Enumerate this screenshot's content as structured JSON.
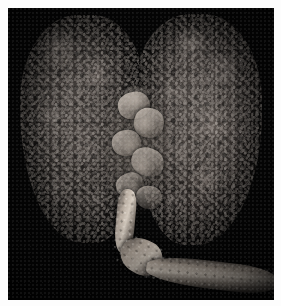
{
  "image": {
    "domain": "Natural-Image",
    "subject": "gross-pathology-lung-specimen",
    "alt_text": "Dark gross pathology photograph of a pair of lungs with nodular studded surfaces, central hilar structures, and a trachea/esophagus extending to the lower right",
    "background_color": "#050505",
    "frame_color": "#fdfdfd",
    "width": 281,
    "height": 306
  },
  "frame": {
    "border_top_px": 8,
    "border_left_px": 8,
    "border_right_px": 7,
    "border_bottom_px": 6
  },
  "specimen": {
    "parts": [
      {
        "id": "lung-left",
        "label": "left lung",
        "surface": "nodular",
        "tone": "#3a3532"
      },
      {
        "id": "lung-right",
        "label": "right lung",
        "surface": "nodular",
        "tone": "#413b37"
      },
      {
        "id": "hilum",
        "label": "hilar structures",
        "tone": "#cec4ba"
      },
      {
        "id": "tube",
        "label": "trachea and esophagus",
        "tone": "#d4c6ba"
      }
    ],
    "palette": {
      "background": "#050505",
      "tissue_dark": "#23201e",
      "tissue_mid": "#5a534e",
      "tissue_light": "#beb4aa",
      "tube_highlight": "#d6ccbe"
    }
  },
  "hilum_chunks": [
    {
      "left": "20%",
      "top": "6%",
      "width": "46%",
      "height": "20%",
      "rot": "-12deg"
    },
    {
      "left": "44%",
      "top": "18%",
      "width": "44%",
      "height": "22%",
      "rot": "16deg"
    },
    {
      "left": "12%",
      "top": "34%",
      "width": "42%",
      "height": "19%",
      "rot": "-8deg"
    },
    {
      "left": "40%",
      "top": "48%",
      "width": "48%",
      "height": "21%",
      "rot": "22deg"
    },
    {
      "left": "18%",
      "top": "66%",
      "width": "40%",
      "height": "18%",
      "rot": "-18deg"
    },
    {
      "left": "46%",
      "top": "76%",
      "width": "38%",
      "height": "17%",
      "rot": "10deg"
    }
  ]
}
